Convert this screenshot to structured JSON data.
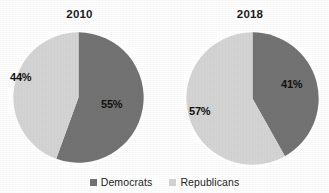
{
  "chart_data": {
    "type": "pie",
    "title": "",
    "legend": {
      "position": "bottom",
      "entries": [
        {
          "name": "Democrats",
          "color": "#737373",
          "swatch_icon": "square-swatch-icon"
        },
        {
          "name": "Republicans",
          "color": "#d4d4d4",
          "swatch_icon": "square-swatch-icon"
        }
      ]
    },
    "charts": [
      {
        "title": "2010",
        "categories": [
          "Democrats",
          "Republicans"
        ],
        "values": [
          55,
          44
        ],
        "labels": [
          "55%",
          "44%"
        ],
        "colors": [
          "#737373",
          "#d4d4d4"
        ],
        "start_angle_deg": 0,
        "direction": "clockwise"
      },
      {
        "title": "2018",
        "categories": [
          "Democrats",
          "Republicans"
        ],
        "values": [
          41,
          57
        ],
        "labels": [
          "41%",
          "57%"
        ],
        "colors": [
          "#737373",
          "#d4d4d4"
        ],
        "start_angle_deg": 0,
        "direction": "clockwise"
      }
    ]
  },
  "panels": [
    {
      "title": "2010",
      "democrat_label": "55%",
      "republican_label": "44%"
    },
    {
      "title": "2018",
      "democrat_label": "41%",
      "republican_label": "57%"
    }
  ],
  "legend": {
    "democrats_label": "Democrats",
    "republicans_label": "Republicans"
  },
  "colors": {
    "democrat": "#737373",
    "republican": "#d4d4d4",
    "background": "#ffffff",
    "text": "#1d1d1d"
  }
}
